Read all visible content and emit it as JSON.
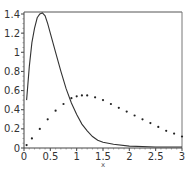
{
  "chart_data": {
    "type": "line",
    "title": "",
    "xlabel": "x",
    "ylabel": "",
    "xlim": [
      0,
      3
    ],
    "ylim": [
      0,
      1.4
    ],
    "grid": false,
    "legend": null,
    "x_ticks": [
      "0",
      "0.5",
      "1",
      "1.5",
      "2",
      "2.5",
      "3"
    ],
    "y_ticks": [
      "0",
      "0.2",
      "0.4",
      "0.6",
      "0.8",
      "1",
      "1.2",
      "1.4"
    ],
    "series": [
      {
        "name": "solid",
        "style": "solid",
        "x": [
          0.05,
          0.1,
          0.15,
          0.2,
          0.25,
          0.3,
          0.35,
          0.4,
          0.45,
          0.5,
          0.6,
          0.7,
          0.8,
          0.9,
          1.0,
          1.1,
          1.2,
          1.3,
          1.4,
          1.5,
          1.7,
          2.0,
          2.5,
          3.0
        ],
        "values": [
          0.5,
          0.85,
          1.1,
          1.25,
          1.36,
          1.4,
          1.41,
          1.38,
          1.3,
          1.2,
          1.0,
          0.8,
          0.62,
          0.47,
          0.35,
          0.25,
          0.18,
          0.12,
          0.08,
          0.06,
          0.04,
          0.02,
          0.01,
          0.01
        ]
      },
      {
        "name": "dotted",
        "style": "dotted",
        "x": [
          0.05,
          0.15,
          0.3,
          0.45,
          0.6,
          0.75,
          0.9,
          1.0,
          1.1,
          1.2,
          1.35,
          1.5,
          1.65,
          1.8,
          1.95,
          2.1,
          2.25,
          2.4,
          2.55,
          2.7,
          2.85,
          3.0
        ],
        "values": [
          0.03,
          0.1,
          0.2,
          0.3,
          0.39,
          0.46,
          0.52,
          0.54,
          0.55,
          0.55,
          0.53,
          0.5,
          0.46,
          0.42,
          0.38,
          0.34,
          0.3,
          0.26,
          0.22,
          0.18,
          0.15,
          0.12
        ]
      }
    ]
  },
  "axis": {
    "x_label": "x"
  }
}
